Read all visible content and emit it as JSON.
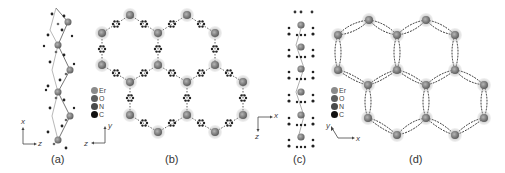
{
  "figure": {
    "panels": [
      {
        "id": "a",
        "label": "(a)",
        "view": "1D helical chain",
        "axes": [
          "x",
          "z"
        ]
      },
      {
        "id": "b",
        "label": "(b)",
        "view": "3D framework",
        "axes": [
          "y",
          "z"
        ]
      },
      {
        "id": "c",
        "label": "(c)",
        "view": "1D chain",
        "axes": [
          "x",
          "z"
        ]
      },
      {
        "id": "d",
        "label": "(d)",
        "view": "3D framework",
        "axes": [
          "y",
          "x"
        ]
      }
    ],
    "legend": {
      "items": [
        {
          "symbol": "Er",
          "color": "#8a8a8a"
        },
        {
          "symbol": "O",
          "color": "#5e5e5e"
        },
        {
          "symbol": "N",
          "color": "#4a4a4a"
        },
        {
          "symbol": "C",
          "color": "#111111"
        }
      ]
    },
    "colors": {
      "er_node": "#7d7d7d",
      "er_halo": "#a9a9a9",
      "bond": "#555555",
      "carbon": "#1a1a1a",
      "background": "#ffffff"
    }
  }
}
